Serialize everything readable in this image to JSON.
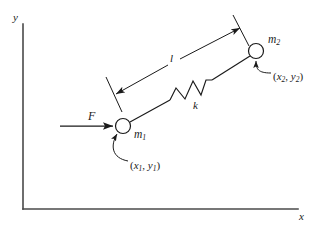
{
  "figure": {
    "type": "physics-free-body-diagram",
    "stroke_color": "#1a1a1a",
    "background_color": "#ffffff"
  },
  "axes": {
    "x_label": "x",
    "y_label": "y",
    "origin": {
      "x": 23,
      "y": 209
    },
    "x_end": {
      "x": 298,
      "y": 209
    },
    "y_end": {
      "x": 23,
      "y": 24
    }
  },
  "force": {
    "label": "F",
    "arrow_start": {
      "x": 60,
      "y": 126
    },
    "arrow_end": {
      "x": 115,
      "y": 126
    },
    "direction": "right"
  },
  "masses": [
    {
      "id": "m1",
      "label": "m",
      "subscript": "1",
      "center": {
        "x": 123,
        "y": 126
      },
      "radius": 7.5,
      "coordinate_label": {
        "open": "(",
        "x_sym": "x",
        "x_sub": "1",
        "comma": ", ",
        "y_sym": "y",
        "y_sub": "1",
        "close": ")"
      }
    },
    {
      "id": "m2",
      "label": "m",
      "subscript": "2",
      "center": {
        "x": 256,
        "y": 51
      },
      "radius": 7.5,
      "coordinate_label": {
        "open": "(",
        "x_sym": "x",
        "x_sub": "2",
        "comma": ", ",
        "y_sym": "y",
        "y_sub": "2",
        "close": ")"
      }
    }
  ],
  "spring": {
    "label": "k",
    "coils": 3,
    "start": {
      "x": 170,
      "y": 100
    },
    "end": {
      "x": 212,
      "y": 80
    }
  },
  "dimension": {
    "label": "l",
    "meaning": "distance between m1 and m2",
    "arrow_start": {
      "x": 115,
      "y": 95
    },
    "arrow_end": {
      "x": 241,
      "y": 28
    },
    "double_headed": true
  }
}
